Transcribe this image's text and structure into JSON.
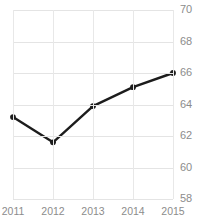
{
  "chart_data": {
    "type": "line",
    "title": "",
    "subtitle": "",
    "xlabel": "",
    "ylabel": "",
    "categories": [
      "2011",
      "2012",
      "2013",
      "2014",
      "2015"
    ],
    "values": [
      63.2,
      61.6,
      63.9,
      65.1,
      66.0
    ],
    "series": [
      {
        "name": "",
        "values": [
          63.2,
          61.6,
          63.9,
          65.1,
          66.0
        ]
      }
    ],
    "ylim": [
      58,
      70
    ],
    "xlim": [
      "2011",
      "2015"
    ],
    "yticks": [
      70,
      68,
      66,
      64,
      62,
      60,
      58
    ],
    "ytick_labels": [
      "70",
      "68",
      "66",
      "64",
      "62",
      "60",
      "58"
    ],
    "xticks": [
      "2011",
      "2012",
      "2013",
      "2014",
      "2015"
    ],
    "xtick_labels": [
      "2011",
      "2012",
      "2013",
      "2014",
      "2015"
    ],
    "grid": true,
    "grid_axis": "both",
    "legend": false,
    "legend_position": "none",
    "y_axis_position": "right",
    "x_axis_position": "bottom",
    "markers": true,
    "colors": {
      "line": "#1c1c1c",
      "marker": "#1c1c1c",
      "gridline": "#e4e4e4",
      "gridline_vertical": "#e8e8e8",
      "tick_label": "#8c8c8c",
      "background": "#ffffff",
      "title": "#c9c9c9"
    }
  }
}
